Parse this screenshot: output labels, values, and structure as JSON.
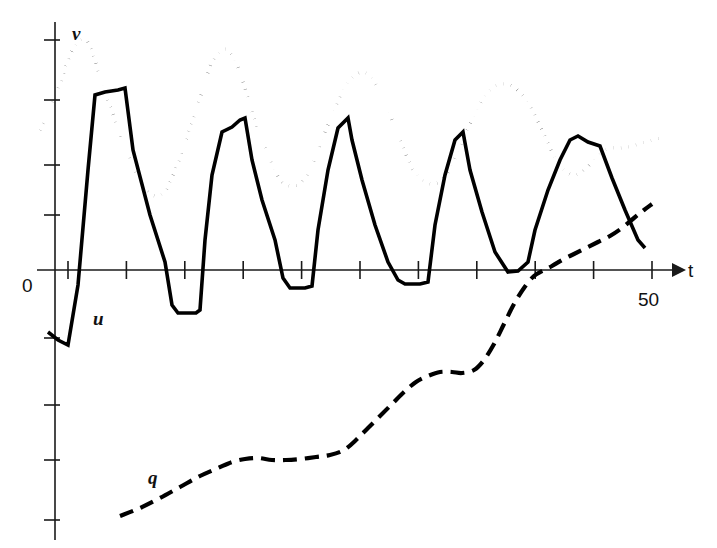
{
  "figure": {
    "background_color": "#ffffff",
    "ink_color": "#000000",
    "width": 717,
    "height": 548
  },
  "axes": {
    "x_axis_label": "t",
    "y_axis_label": "",
    "origin_label": "0",
    "x_tick_labels": [
      {
        "value": "50",
        "t": 50
      }
    ],
    "x_axis_y_pixel": 270,
    "y_axis_x_pixel": 55,
    "x_tick_count": 11,
    "y_tick_count": 8
  },
  "labels": {
    "u": "u",
    "v": "v",
    "q": "q",
    "t": "t",
    "zero": "0",
    "fifty": "50"
  },
  "chart_data": {
    "type": "line",
    "title": "",
    "subtitle": "",
    "xlabel": "t",
    "ylabel": "",
    "grid": false,
    "legend_position": "inline-curve-labels",
    "xlim": [
      -2,
      57
    ],
    "ylim": [
      -3.6,
      4.6
    ],
    "x_ticks": [
      0,
      5,
      10,
      15,
      20,
      25,
      30,
      35,
      40,
      45,
      50
    ],
    "x_tick_labels_shown": [
      "",
      "",
      "",
      "",
      "",
      "",
      "",
      "",
      "",
      "",
      "50"
    ],
    "y_ticks": [
      -3,
      -2.4,
      -1.8,
      -0.6,
      0,
      1.2,
      2.4,
      3.6
    ],
    "annotations": [
      {
        "text": "v",
        "style": "italic",
        "x_pixel": 72,
        "y_pixel": 40,
        "series": "v"
      },
      {
        "text": "u",
        "style": "italic",
        "x_pixel": 93,
        "y_pixel": 325,
        "series": "u"
      },
      {
        "text": "q",
        "style": "italic",
        "x_pixel": 148,
        "y_pixel": 484,
        "series": "q"
      },
      {
        "text": "0",
        "style": "normal",
        "x_pixel": 28,
        "y_pixel": 291,
        "series": "axis"
      },
      {
        "text": "50",
        "style": "normal",
        "x_pixel": 640,
        "y_pixel": 305,
        "series": "axis"
      },
      {
        "text": "t",
        "style": "normal",
        "x_pixel": 688,
        "y_pixel": 277,
        "series": "axis"
      }
    ],
    "series": [
      {
        "name": "u",
        "line_style": "solid",
        "description": "sawtooth oscillation with sharp rises, flat crests and dips below zero, slowly damping",
        "points_pixel": [
          [
            48,
            332
          ],
          [
            58,
            340
          ],
          [
            68,
            345
          ],
          [
            78,
            285
          ],
          [
            88,
            170
          ],
          [
            95,
            95
          ],
          [
            105,
            92
          ],
          [
            118,
            90
          ],
          [
            125,
            88
          ],
          [
            133,
            150
          ],
          [
            150,
            215
          ],
          [
            165,
            262
          ],
          [
            172,
            305
          ],
          [
            178,
            313
          ],
          [
            196,
            313
          ],
          [
            200,
            310
          ],
          [
            205,
            240
          ],
          [
            212,
            175
          ],
          [
            222,
            132
          ],
          [
            232,
            127
          ],
          [
            240,
            120
          ],
          [
            245,
            118
          ],
          [
            252,
            160
          ],
          [
            262,
            200
          ],
          [
            275,
            240
          ],
          [
            283,
            278
          ],
          [
            290,
            288
          ],
          [
            305,
            288
          ],
          [
            312,
            286
          ],
          [
            318,
            230
          ],
          [
            328,
            170
          ],
          [
            338,
            128
          ],
          [
            348,
            118
          ],
          [
            352,
            140
          ],
          [
            362,
            180
          ],
          [
            375,
            225
          ],
          [
            388,
            262
          ],
          [
            398,
            280
          ],
          [
            405,
            284
          ],
          [
            420,
            284
          ],
          [
            428,
            282
          ],
          [
            435,
            225
          ],
          [
            445,
            175
          ],
          [
            455,
            140
          ],
          [
            463,
            132
          ],
          [
            470,
            170
          ],
          [
            482,
            212
          ],
          [
            495,
            252
          ],
          [
            508,
            272
          ],
          [
            518,
            271
          ],
          [
            528,
            262
          ],
          [
            535,
            230
          ],
          [
            548,
            190
          ],
          [
            560,
            160
          ],
          [
            570,
            140
          ],
          [
            578,
            136
          ],
          [
            588,
            142
          ],
          [
            600,
            146
          ],
          [
            612,
            178
          ],
          [
            625,
            210
          ],
          [
            638,
            240
          ],
          [
            645,
            248
          ]
        ]
      },
      {
        "name": "v",
        "line_style": "dotted",
        "description": "smooth oscillation lagging u, positive throughout, period about 9 time units",
        "points_pixel": [
          [
            40,
            130
          ],
          [
            46,
            120
          ],
          [
            54,
            100
          ],
          [
            62,
            78
          ],
          [
            70,
            55
          ],
          [
            78,
            42
          ],
          [
            86,
            40
          ],
          [
            92,
            52
          ],
          [
            98,
            70
          ],
          [
            106,
            95
          ],
          [
            116,
            122
          ],
          [
            126,
            150
          ],
          [
            136,
            172
          ],
          [
            146,
            190
          ],
          [
            156,
            196
          ],
          [
            166,
            190
          ],
          [
            176,
            168
          ],
          [
            186,
            140
          ],
          [
            196,
            112
          ],
          [
            204,
            85
          ],
          [
            212,
            62
          ],
          [
            220,
            52
          ],
          [
            228,
            50
          ],
          [
            236,
            62
          ],
          [
            244,
            85
          ],
          [
            252,
            112
          ],
          [
            262,
            140
          ],
          [
            272,
            165
          ],
          [
            282,
            182
          ],
          [
            292,
            186
          ],
          [
            302,
            182
          ],
          [
            312,
            165
          ],
          [
            322,
            140
          ],
          [
            332,
            115
          ],
          [
            342,
            92
          ],
          [
            352,
            78
          ],
          [
            362,
            72
          ],
          [
            372,
            78
          ],
          [
            382,
            96
          ],
          [
            392,
            120
          ],
          [
            402,
            145
          ],
          [
            412,
            168
          ],
          [
            422,
            180
          ],
          [
            432,
            184
          ],
          [
            442,
            180
          ],
          [
            452,
            165
          ],
          [
            462,
            142
          ],
          [
            472,
            120
          ],
          [
            482,
            100
          ],
          [
            492,
            88
          ],
          [
            502,
            84
          ],
          [
            512,
            86
          ],
          [
            522,
            95
          ],
          [
            532,
            110
          ],
          [
            542,
            130
          ],
          [
            552,
            152
          ],
          [
            562,
            168
          ],
          [
            572,
            175
          ],
          [
            582,
            172
          ],
          [
            592,
            162
          ],
          [
            602,
            152
          ],
          [
            612,
            148
          ],
          [
            622,
            148
          ],
          [
            632,
            146
          ],
          [
            642,
            143
          ],
          [
            652,
            140
          ],
          [
            660,
            138
          ]
        ]
      },
      {
        "name": "q",
        "line_style": "dashed",
        "description": "monotonically increasing staircase-like ramp from bottom left to upper right",
        "points_pixel": [
          [
            120,
            516
          ],
          [
            140,
            508
          ],
          [
            160,
            498
          ],
          [
            180,
            487
          ],
          [
            200,
            476
          ],
          [
            218,
            468
          ],
          [
            232,
            462
          ],
          [
            245,
            459
          ],
          [
            258,
            458
          ],
          [
            272,
            460
          ],
          [
            286,
            460
          ],
          [
            300,
            459
          ],
          [
            316,
            457
          ],
          [
            330,
            455
          ],
          [
            344,
            450
          ],
          [
            356,
            440
          ],
          [
            368,
            428
          ],
          [
            380,
            416
          ],
          [
            392,
            404
          ],
          [
            404,
            392
          ],
          [
            416,
            382
          ],
          [
            428,
            376
          ],
          [
            440,
            372
          ],
          [
            452,
            372
          ],
          [
            462,
            373
          ],
          [
            474,
            370
          ],
          [
            484,
            360
          ],
          [
            494,
            344
          ],
          [
            504,
            324
          ],
          [
            514,
            304
          ],
          [
            524,
            288
          ],
          [
            534,
            276
          ],
          [
            544,
            270
          ],
          [
            552,
            266
          ],
          [
            562,
            260
          ],
          [
            574,
            254
          ],
          [
            586,
            248
          ],
          [
            598,
            242
          ],
          [
            610,
            236
          ],
          [
            622,
            228
          ],
          [
            634,
            218
          ],
          [
            644,
            210
          ],
          [
            652,
            204
          ]
        ]
      }
    ]
  }
}
